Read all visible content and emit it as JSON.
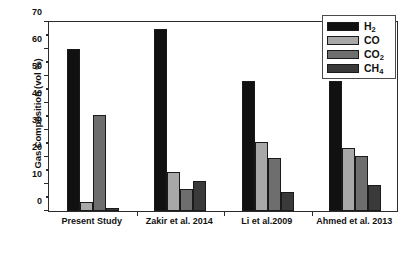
{
  "chart_data": {
    "type": "bar",
    "title": "",
    "xlabel": "",
    "ylabel": "Gas Composition (vol %)",
    "ylim": [
      0,
      70
    ],
    "ytick_step": 10,
    "yticks": [
      0,
      10,
      20,
      30,
      40,
      50,
      60,
      70
    ],
    "minor_ticks": true,
    "grid": false,
    "legend_position": "top-right",
    "categories": [
      "Present Study",
      "Zakir et al. 2014",
      "Li et al.2009",
      "Ahmed et al. 2013"
    ],
    "series": [
      {
        "name": "H2",
        "label": "H",
        "sub": "2",
        "color": "#111111",
        "values": [
          60.0,
          67.5,
          48.0,
          48.0
        ]
      },
      {
        "name": "CO",
        "label": "CO",
        "sub": "",
        "color": "#a8a8a8",
        "values": [
          3.5,
          14.5,
          25.5,
          23.5
        ]
      },
      {
        "name": "CO2",
        "label": "CO",
        "sub": "2",
        "color": "#6e6e6e",
        "values": [
          35.5,
          8.0,
          19.5,
          20.5
        ]
      },
      {
        "name": "CH4",
        "label": "CH",
        "sub": "4",
        "color": "#3a3a3a",
        "values": [
          1.0,
          11.0,
          7.0,
          9.5
        ]
      }
    ]
  },
  "legend": {
    "entries": [
      {
        "text": "H",
        "sub": "2"
      },
      {
        "text": "CO",
        "sub": ""
      },
      {
        "text": "CO",
        "sub": "2"
      },
      {
        "text": "CH",
        "sub": "4"
      }
    ]
  },
  "axes": {
    "y_title": "Gas Composition (vol %)",
    "y_tick_labels": [
      "0",
      "10",
      "20",
      "30",
      "40",
      "50",
      "60",
      "70"
    ],
    "x_tick_labels": [
      "Present Study",
      "Zakir et al. 2014",
      "Li et al.2009",
      "Ahmed et al. 2013"
    ]
  }
}
